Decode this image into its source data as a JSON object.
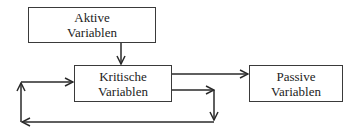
{
  "diagram": {
    "nodes": [
      {
        "id": "aktive",
        "line1": "Aktive",
        "line2": "Variablen"
      },
      {
        "id": "kritische",
        "line1": "Kritische",
        "line2": "Variablen"
      },
      {
        "id": "passive",
        "line1": "Passive",
        "line2": "Variablen"
      }
    ],
    "edges": [
      {
        "from": "aktive",
        "to": "kritische"
      },
      {
        "from": "kritische",
        "to": "passive"
      },
      {
        "from": "kritische",
        "to": "kritische",
        "label": "feedback loop"
      }
    ],
    "colors": {
      "stroke": "#2a2a2a",
      "text": "#222222",
      "background": "#ffffff"
    }
  }
}
